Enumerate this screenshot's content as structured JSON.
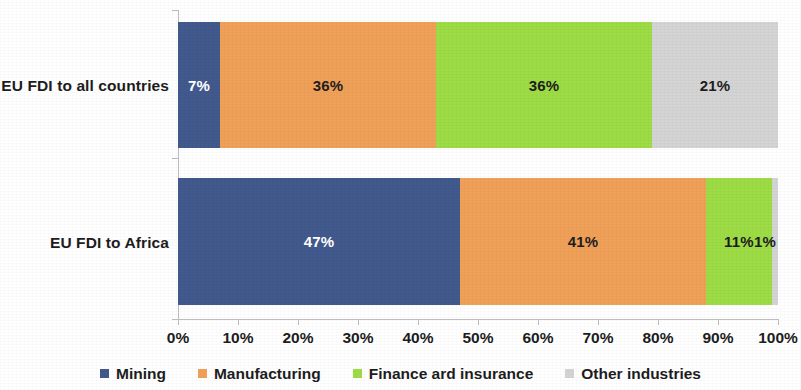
{
  "chart_data": {
    "type": "bar",
    "orientation": "horizontal",
    "stacked": true,
    "normalized_100pct": true,
    "title": "",
    "subtitle": "",
    "xlabel": "",
    "ylabel": "",
    "categories": [
      "EU FDI to all countries",
      "EU FDI to Africa"
    ],
    "series": [
      {
        "name": "Mining",
        "color": "#41598c",
        "values": [
          7,
          47
        ]
      },
      {
        "name": "Manufacturing",
        "color": "#f0a159",
        "values": [
          36,
          41
        ]
      },
      {
        "name": "Finance ard insurance",
        "color": "#9ddc45",
        "values": [
          36,
          11
        ]
      },
      {
        "name": "Other industries",
        "color": "#d4d4d4",
        "values": [
          21,
          1
        ]
      }
    ],
    "data_labels": [
      [
        "7%",
        "36%",
        "36%",
        "21%"
      ],
      [
        "47%",
        "41%",
        "11%",
        "1%"
      ]
    ],
    "xlim": [
      0,
      100
    ],
    "xticks": [
      0,
      10,
      20,
      30,
      40,
      50,
      60,
      70,
      80,
      90,
      100
    ],
    "xtick_labels": [
      "0%",
      "10%",
      "20%",
      "30%",
      "40%",
      "50%",
      "60%",
      "70%",
      "80%",
      "90%",
      "100%"
    ],
    "grid": false,
    "legend_position": "bottom"
  },
  "legend": {
    "items": [
      {
        "label": "Mining",
        "color": "#41598c"
      },
      {
        "label": "Manufacturing",
        "color": "#f0a159"
      },
      {
        "label": "Finance ard insurance",
        "color": "#9ddc45"
      },
      {
        "label": "Other industries",
        "color": "#d4d4d4"
      }
    ]
  },
  "colors": {
    "mining": "#41598c",
    "manufacturing": "#f0a159",
    "finance": "#9ddc45",
    "other": "#d4d4d4",
    "axis": "#bdbdbd",
    "text": "#1d1d1d",
    "background": "#ffffff"
  }
}
